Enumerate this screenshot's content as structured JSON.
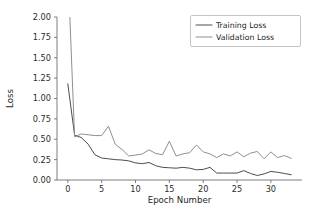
{
  "chart_data": {
    "type": "line",
    "title": "",
    "xlabel": "Epoch Number",
    "ylabel": "Loss",
    "xlim": [
      -1.6,
      34.6
    ],
    "ylim": [
      0.0,
      2.0
    ],
    "grid": false,
    "legend_position": "upper right",
    "xticks": [
      0,
      5,
      10,
      15,
      20,
      25,
      30
    ],
    "xtick_labels": [
      "0",
      "5",
      "10",
      "15",
      "20",
      "25",
      "30"
    ],
    "yticks": [
      0.0,
      0.25,
      0.5,
      0.75,
      1.0,
      1.25,
      1.5,
      1.75,
      2.0
    ],
    "ytick_labels": [
      "0.00",
      "0.25",
      "0.50",
      "0.75",
      "1.00",
      "1.25",
      "1.50",
      "1.75",
      "2.00"
    ],
    "x": [
      0,
      1,
      2,
      3,
      4,
      5,
      6,
      7,
      8,
      9,
      10,
      11,
      12,
      13,
      14,
      15,
      16,
      17,
      18,
      19,
      20,
      21,
      22,
      23,
      24,
      25,
      26,
      27,
      28,
      29,
      30,
      31,
      32,
      33
    ],
    "series": [
      {
        "name": "Training Loss",
        "color": "#4d4d4d",
        "values": [
          1.18,
          0.55,
          0.52,
          0.44,
          0.31,
          0.27,
          0.26,
          0.25,
          0.245,
          0.235,
          0.21,
          0.2,
          0.215,
          0.175,
          0.155,
          0.15,
          0.145,
          0.155,
          0.145,
          0.125,
          0.13,
          0.155,
          0.085,
          0.085,
          0.085,
          0.085,
          0.115,
          0.08,
          0.055,
          0.075,
          0.105,
          0.095,
          0.08,
          0.065
        ]
      },
      {
        "name": "Validation Loss",
        "color": "#8f8f8f",
        "values": [
          2.62,
          0.53,
          0.565,
          0.555,
          0.545,
          0.545,
          0.66,
          0.44,
          0.375,
          0.295,
          0.305,
          0.32,
          0.37,
          0.325,
          0.31,
          0.475,
          0.295,
          0.32,
          0.335,
          0.43,
          0.345,
          0.32,
          0.275,
          0.32,
          0.295,
          0.345,
          0.285,
          0.33,
          0.35,
          0.26,
          0.345,
          0.275,
          0.3,
          0.265
        ]
      }
    ],
    "legend_entries": [
      {
        "label": "Training Loss",
        "color": "#4d4d4d"
      },
      {
        "label": "Validation Loss",
        "color": "#8f8f8f"
      }
    ],
    "colors": {
      "training": "#4d4d4d",
      "validation": "#8f8f8f",
      "axis": "#6f6f6f",
      "text": "#1f1f1f",
      "background": "#ffffff"
    }
  }
}
